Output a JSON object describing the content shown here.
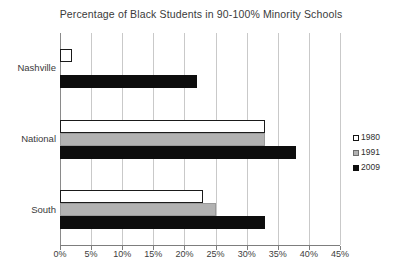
{
  "chart_data": {
    "type": "bar",
    "orientation": "horizontal",
    "title": "Percentage of Black Students in 90-100% Minority Schools",
    "xlabel": "",
    "ylabel": "",
    "categories": [
      "Nashville",
      "National",
      "South"
    ],
    "series": [
      {
        "name": "1980",
        "color": "#ffffff",
        "values": [
          2,
          33,
          23
        ]
      },
      {
        "name": "1991",
        "color": "#b2b2b2",
        "values": [
          0,
          33,
          25
        ]
      },
      {
        "name": "2009",
        "color": "#0d0d0d",
        "values": [
          22,
          38,
          33
        ]
      }
    ],
    "xlim": [
      0,
      45
    ],
    "xtick_values": [
      0,
      5,
      10,
      15,
      20,
      25,
      30,
      35,
      40,
      45
    ],
    "xtick_labels": [
      "0%",
      "5%",
      "10%",
      "15%",
      "20%",
      "25%",
      "30%",
      "35%",
      "40%",
      "45%"
    ],
    "grid": true,
    "grid_axis": "x",
    "legend_position": "right"
  }
}
